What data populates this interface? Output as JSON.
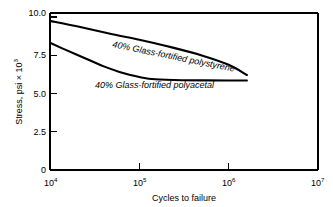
{
  "chart_data": {
    "type": "line",
    "title": "",
    "xlabel": "Cycles to failure",
    "ylabel": "Stress, psi × 10",
    "ylabel_exponent": "3",
    "xscale": "log",
    "yscale": "linear",
    "xlim": [
      10000,
      10000000
    ],
    "ylim": [
      0,
      10.0
    ],
    "grid": false,
    "legend": "inline-curve-labels",
    "x_tick_bases": [
      "10",
      "10",
      "10",
      "10"
    ],
    "x_tick_exponents": [
      "4",
      "5",
      "6",
      "7"
    ],
    "x_tick_values": [
      10000,
      100000,
      1000000,
      10000000
    ],
    "y_ticks": [
      "0",
      "2.5",
      "5.0",
      "7.5",
      "10.0"
    ],
    "y_tick_values": [
      0,
      2.5,
      5.0,
      7.5,
      10.0
    ],
    "series": [
      {
        "name": "40% Glass-fortified polystyrene",
        "label": "40% Glass-fortified polystyrene",
        "x": [
          10000,
          20000,
          50000,
          100000,
          200000,
          500000,
          1000000,
          1600000
        ],
        "y": [
          9.5,
          9.15,
          8.65,
          8.3,
          7.9,
          7.3,
          6.7,
          6.05
        ]
      },
      {
        "name": "40% Glass-fortified polyacetal",
        "label": "40% Glass-fortified polyacetal",
        "x": [
          10000,
          15000,
          25000,
          40000,
          60000,
          80000,
          100000,
          150000,
          300000,
          1000000,
          1600000
        ],
        "y": [
          8.1,
          7.65,
          7.1,
          6.6,
          6.25,
          6.05,
          5.92,
          5.78,
          5.72,
          5.7,
          5.7
        ]
      }
    ]
  },
  "style": {
    "axis_color": "#000000",
    "curve_color": "#000000",
    "background": "#ffffff"
  }
}
